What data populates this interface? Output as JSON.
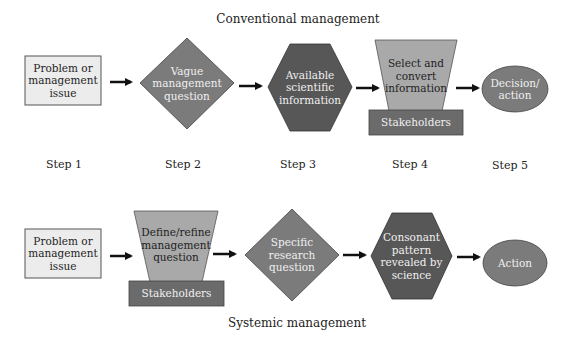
{
  "conventional": {
    "title": "Conventional management",
    "nodes": [
      {
        "id": "c1",
        "shape": "rectangle",
        "label": "Problem or\nmanagement\nissue",
        "fill": "#ececec"
      },
      {
        "id": "c2",
        "shape": "diamond",
        "label": "Vague\nmanagement\nquestion",
        "fill": "#7b7b7b"
      },
      {
        "id": "c3",
        "shape": "hexagon",
        "label": "Available\nscientific\ninformation",
        "fill": "#575757"
      },
      {
        "id": "c4",
        "shape": "trapezoid",
        "label": "Select and\nconvert\ninformation",
        "fill": "#a9a9a9"
      },
      {
        "id": "c4b",
        "shape": "rectangle",
        "label": "Stakeholders",
        "fill": "#6b6b6b"
      },
      {
        "id": "c5",
        "shape": "ellipse",
        "label": "Decision/\naction",
        "fill": "#7b7b7b"
      }
    ]
  },
  "steps": [
    "Step 1",
    "Step 2",
    "Step 3",
    "Step 4",
    "Step 5"
  ],
  "systemic": {
    "title": "Systemic management",
    "nodes": [
      {
        "id": "s1",
        "shape": "rectangle",
        "label": "Problem or\nmanagement\nissue",
        "fill": "#ececec"
      },
      {
        "id": "s2",
        "shape": "trapezoid",
        "label": "Define/refine\nmanagement\nquestion",
        "fill": "#a9a9a9"
      },
      {
        "id": "s2b",
        "shape": "rectangle",
        "label": "Stakeholders",
        "fill": "#6b6b6b"
      },
      {
        "id": "s3",
        "shape": "diamond",
        "label": "Specific\nresearch\nquestion",
        "fill": "#7b7b7b"
      },
      {
        "id": "s4",
        "shape": "hexagon",
        "label": "Consonant\npattern\nrevealed by\nscience",
        "fill": "#575757"
      },
      {
        "id": "s5",
        "shape": "ellipse",
        "label": "Action",
        "fill": "#7b7b7b"
      }
    ]
  },
  "colors": {
    "stroke": "#3a3a3a",
    "arrow": "#111111",
    "text_dark": "#1e1e1e",
    "text_light": "#f0f0f0"
  }
}
